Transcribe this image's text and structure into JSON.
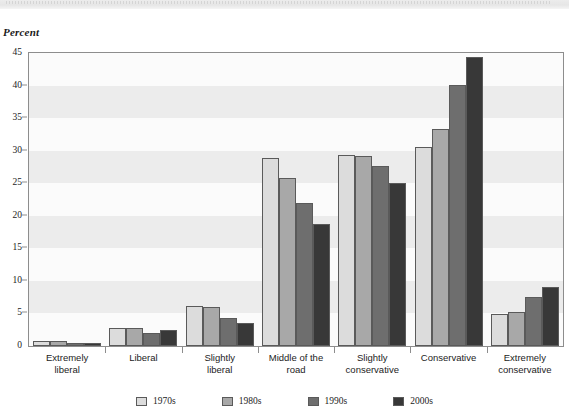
{
  "axis_title": "Percent",
  "chart_data": {
    "type": "bar",
    "title": "",
    "subtitle": "",
    "xlabel": "",
    "ylabel": "Percent",
    "ylim": [
      0,
      45
    ],
    "yticks": [
      0,
      5,
      10,
      15,
      20,
      25,
      30,
      35,
      40,
      45
    ],
    "grid": "horizontal-alternating-bands",
    "legend_position": "bottom-center",
    "categories": [
      "Extremely liberal",
      "Liberal",
      "Slightly liberal",
      "Middle of the road",
      "Slightly conservative",
      "Conservative",
      "Extremely conservative"
    ],
    "category_lines": [
      [
        "Extremely",
        "liberal"
      ],
      [
        "Liberal"
      ],
      [
        "Slightly",
        "liberal"
      ],
      [
        "Middle of the",
        "road"
      ],
      [
        "Slightly",
        "conservative"
      ],
      [
        "Conservative"
      ],
      [
        "Extremely",
        "conservative"
      ]
    ],
    "series": [
      {
        "name": "1970s",
        "color": "#dcdcdc",
        "values": [
          0.8,
          2.8,
          6.2,
          28.9,
          29.3,
          30.5,
          4.9
        ]
      },
      {
        "name": "1980s",
        "color": "#a8a8a8",
        "values": [
          0.7,
          2.8,
          6.0,
          25.8,
          29.2,
          33.3,
          5.3
        ]
      },
      {
        "name": "1990s",
        "color": "#6e6e6e",
        "values": [
          0.5,
          2.0,
          4.3,
          21.9,
          27.6,
          40.1,
          7.5
        ]
      },
      {
        "name": "2000s",
        "color": "#383838",
        "values": [
          0.4,
          2.5,
          3.5,
          18.7,
          25.0,
          44.4,
          9.0
        ]
      }
    ]
  },
  "colors": {
    "frame": "#8d8d8d",
    "band": "#ececec",
    "plot_background": "#fbfbfb",
    "bar_outline": "#5a5a5a",
    "text": "#1c1c1c"
  }
}
